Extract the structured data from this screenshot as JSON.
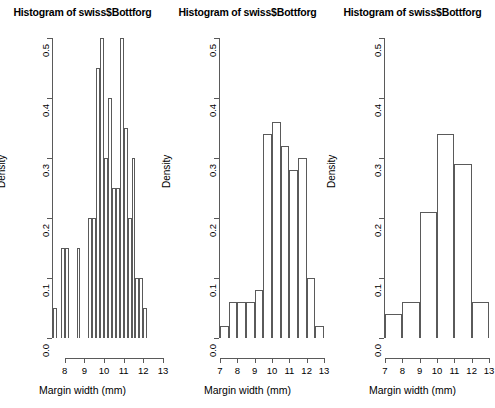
{
  "page": {
    "background_color": "#ffffff",
    "axis_color": "#5a5a5a",
    "text_color": "#000000",
    "width": 495,
    "height": 408,
    "layout": "three histogram panels side by side"
  },
  "labels": {
    "ylabel": "Density",
    "xlabel": "Margin width (mm)",
    "title": "Histogram of swiss$Bottforg"
  },
  "chart_data": [
    {
      "type": "bar",
      "subtype": "histogram",
      "panel_index": 1,
      "title": "Histogram of swiss$Bottforg",
      "xlabel": "Margin width (mm)",
      "ylabel": "Density",
      "xlim": [
        7.4,
        12.8
      ],
      "ylim": [
        0.0,
        0.5
      ],
      "xticks": [
        8,
        9,
        10,
        11,
        12,
        13
      ],
      "xtick_labels": [
        "8",
        "9",
        "10",
        "11",
        "12",
        "13"
      ],
      "yticks": [
        0.0,
        0.1,
        0.2,
        0.3,
        0.4,
        0.5
      ],
      "ytick_labels": [
        "0.0",
        "0.1",
        "0.2",
        "0.3",
        "0.4",
        "0.5"
      ],
      "grid": false,
      "legend": false,
      "bin_width": 0.2,
      "bin_edges": [
        7.4,
        7.6,
        7.8,
        8.0,
        8.2,
        8.4,
        8.6,
        8.8,
        9.0,
        9.2,
        9.4,
        9.6,
        9.8,
        10.0,
        10.2,
        10.4,
        10.6,
        10.8,
        11.0,
        11.2,
        11.4,
        11.6,
        11.8,
        12.0,
        12.2,
        12.4,
        12.6,
        12.8
      ],
      "categories": [
        "7.4-7.6",
        "7.6-7.8",
        "7.8-8.0",
        "8.0-8.2",
        "8.2-8.4",
        "8.4-8.6",
        "8.6-8.8",
        "8.8-9.0",
        "9.0-9.2",
        "9.2-9.4",
        "9.4-9.6",
        "9.6-9.8",
        "9.8-10.0",
        "10.0-10.2",
        "10.2-10.4",
        "10.4-10.6",
        "10.6-10.8",
        "10.8-11.0",
        "11.0-11.2",
        "11.2-11.4",
        "11.4-11.6",
        "11.6-11.8",
        "11.8-12.0",
        "12.0-12.2",
        "12.2-12.4",
        "12.4-12.6",
        "12.6-12.8"
      ],
      "values": [
        0.05,
        0.0,
        0.15,
        0.15,
        0.0,
        0.0,
        0.15,
        0.0,
        0.0,
        0.2,
        0.2,
        0.45,
        0.5,
        0.3,
        0.4,
        0.25,
        0.25,
        0.5,
        0.35,
        0.2,
        0.3,
        0.1,
        0.1,
        0.05
      ]
    },
    {
      "type": "bar",
      "subtype": "histogram",
      "panel_index": 2,
      "title": "Histogram of swiss$Bottforg",
      "xlabel": "Margin width (mm)",
      "ylabel": "Density",
      "xlim": [
        7.0,
        13.0
      ],
      "ylim": [
        0.0,
        0.5
      ],
      "xticks": [
        7,
        8,
        9,
        10,
        11,
        12,
        13
      ],
      "xtick_labels": [
        "7",
        "8",
        "9",
        "10",
        "11",
        "12",
        "13"
      ],
      "yticks": [
        0.0,
        0.1,
        0.2,
        0.3,
        0.4,
        0.5
      ],
      "ytick_labels": [
        "0.0",
        "0.1",
        "0.2",
        "0.3",
        "0.4",
        "0.5"
      ],
      "grid": false,
      "legend": false,
      "bin_width": 0.5,
      "bin_edges": [
        7.0,
        7.5,
        8.0,
        8.5,
        9.0,
        9.5,
        10.0,
        10.5,
        11.0,
        11.5,
        12.0,
        12.5,
        13.0
      ],
      "categories": [
        "7.0-7.5",
        "7.5-8.0",
        "8.0-8.5",
        "8.5-9.0",
        "9.0-9.5",
        "9.5-10.0",
        "10.0-10.5",
        "10.5-11.0",
        "11.0-11.5",
        "11.5-12.0",
        "12.0-12.5",
        "12.5-13.0"
      ],
      "values": [
        0.02,
        0.06,
        0.06,
        0.06,
        0.08,
        0.34,
        0.36,
        0.32,
        0.28,
        0.3,
        0.1,
        0.02
      ]
    },
    {
      "type": "bar",
      "subtype": "histogram",
      "panel_index": 3,
      "title": "Histogram of swiss$Bottforg",
      "xlabel": "Margin width (mm)",
      "ylabel": "Density",
      "xlim": [
        7.0,
        13.0
      ],
      "ylim": [
        0.0,
        0.5
      ],
      "xticks": [
        7,
        8,
        9,
        10,
        11,
        12,
        13
      ],
      "xtick_labels": [
        "7",
        "8",
        "9",
        "10",
        "11",
        "12",
        "13"
      ],
      "yticks": [
        0.0,
        0.1,
        0.2,
        0.3,
        0.4,
        0.5
      ],
      "ytick_labels": [
        "0.0",
        "0.1",
        "0.2",
        "0.3",
        "0.4",
        "0.5"
      ],
      "grid": false,
      "legend": false,
      "bin_width": 1,
      "bin_edges": [
        7,
        8,
        9,
        10,
        11,
        12,
        13
      ],
      "categories": [
        "7-8",
        "8-9",
        "9-10",
        "10-11",
        "11-12",
        "12-13"
      ],
      "values": [
        0.04,
        0.06,
        0.21,
        0.34,
        0.29,
        0.06
      ]
    }
  ]
}
